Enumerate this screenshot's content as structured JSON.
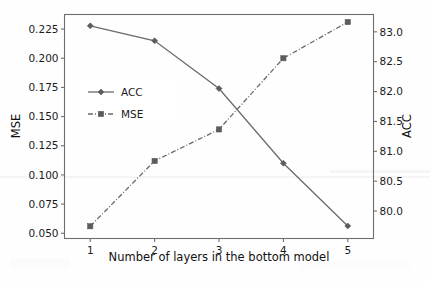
{
  "chart_data": {
    "type": "line",
    "title": "",
    "xlabel": "Number of layers in the bottom model",
    "ylabel": "MSE",
    "y2label": "ACC",
    "x": [
      1,
      2,
      3,
      4,
      5
    ],
    "xticklabels": [
      "1",
      "2",
      "3",
      "4",
      "5"
    ],
    "xlim": [
      0.6,
      5.4
    ],
    "ylim": [
      0.0455,
      0.2375
    ],
    "yticks": [
      0.05,
      0.075,
      0.1,
      0.125,
      0.15,
      0.175,
      0.2,
      0.225
    ],
    "yticklabels": [
      "0.050",
      "0.075",
      "0.100",
      "0.125",
      "0.150",
      "0.175",
      "0.200",
      "0.225"
    ],
    "y2lim": [
      79.54,
      83.29
    ],
    "y2ticks": [
      80.0,
      80.5,
      81.0,
      81.5,
      82.0,
      82.5,
      83.0
    ],
    "y2ticklabels": [
      "80.0",
      "80.5",
      "81.0",
      "81.5",
      "82.0",
      "82.5",
      "83.0"
    ],
    "grid": false,
    "legend_position": "upper left",
    "series": [
      {
        "name": "ACC",
        "axis": "right",
        "linestyle": "solid",
        "marker": "diamond",
        "color": "#6b6b6b",
        "values": [
          83.1,
          82.85,
          82.05,
          80.8,
          79.75
        ]
      },
      {
        "name": "MSE",
        "axis": "left",
        "linestyle": "dashdot",
        "marker": "square",
        "color": "#6b6b6b",
        "values": [
          0.056,
          0.112,
          0.139,
          0.2,
          0.231
        ]
      }
    ]
  },
  "legend": {
    "entries": [
      {
        "label": "ACC"
      },
      {
        "label": "MSE"
      }
    ]
  },
  "axes": {
    "x_title": "Number of layers in the bottom model",
    "y_left_title": "MSE",
    "y_right_title": "ACC"
  }
}
